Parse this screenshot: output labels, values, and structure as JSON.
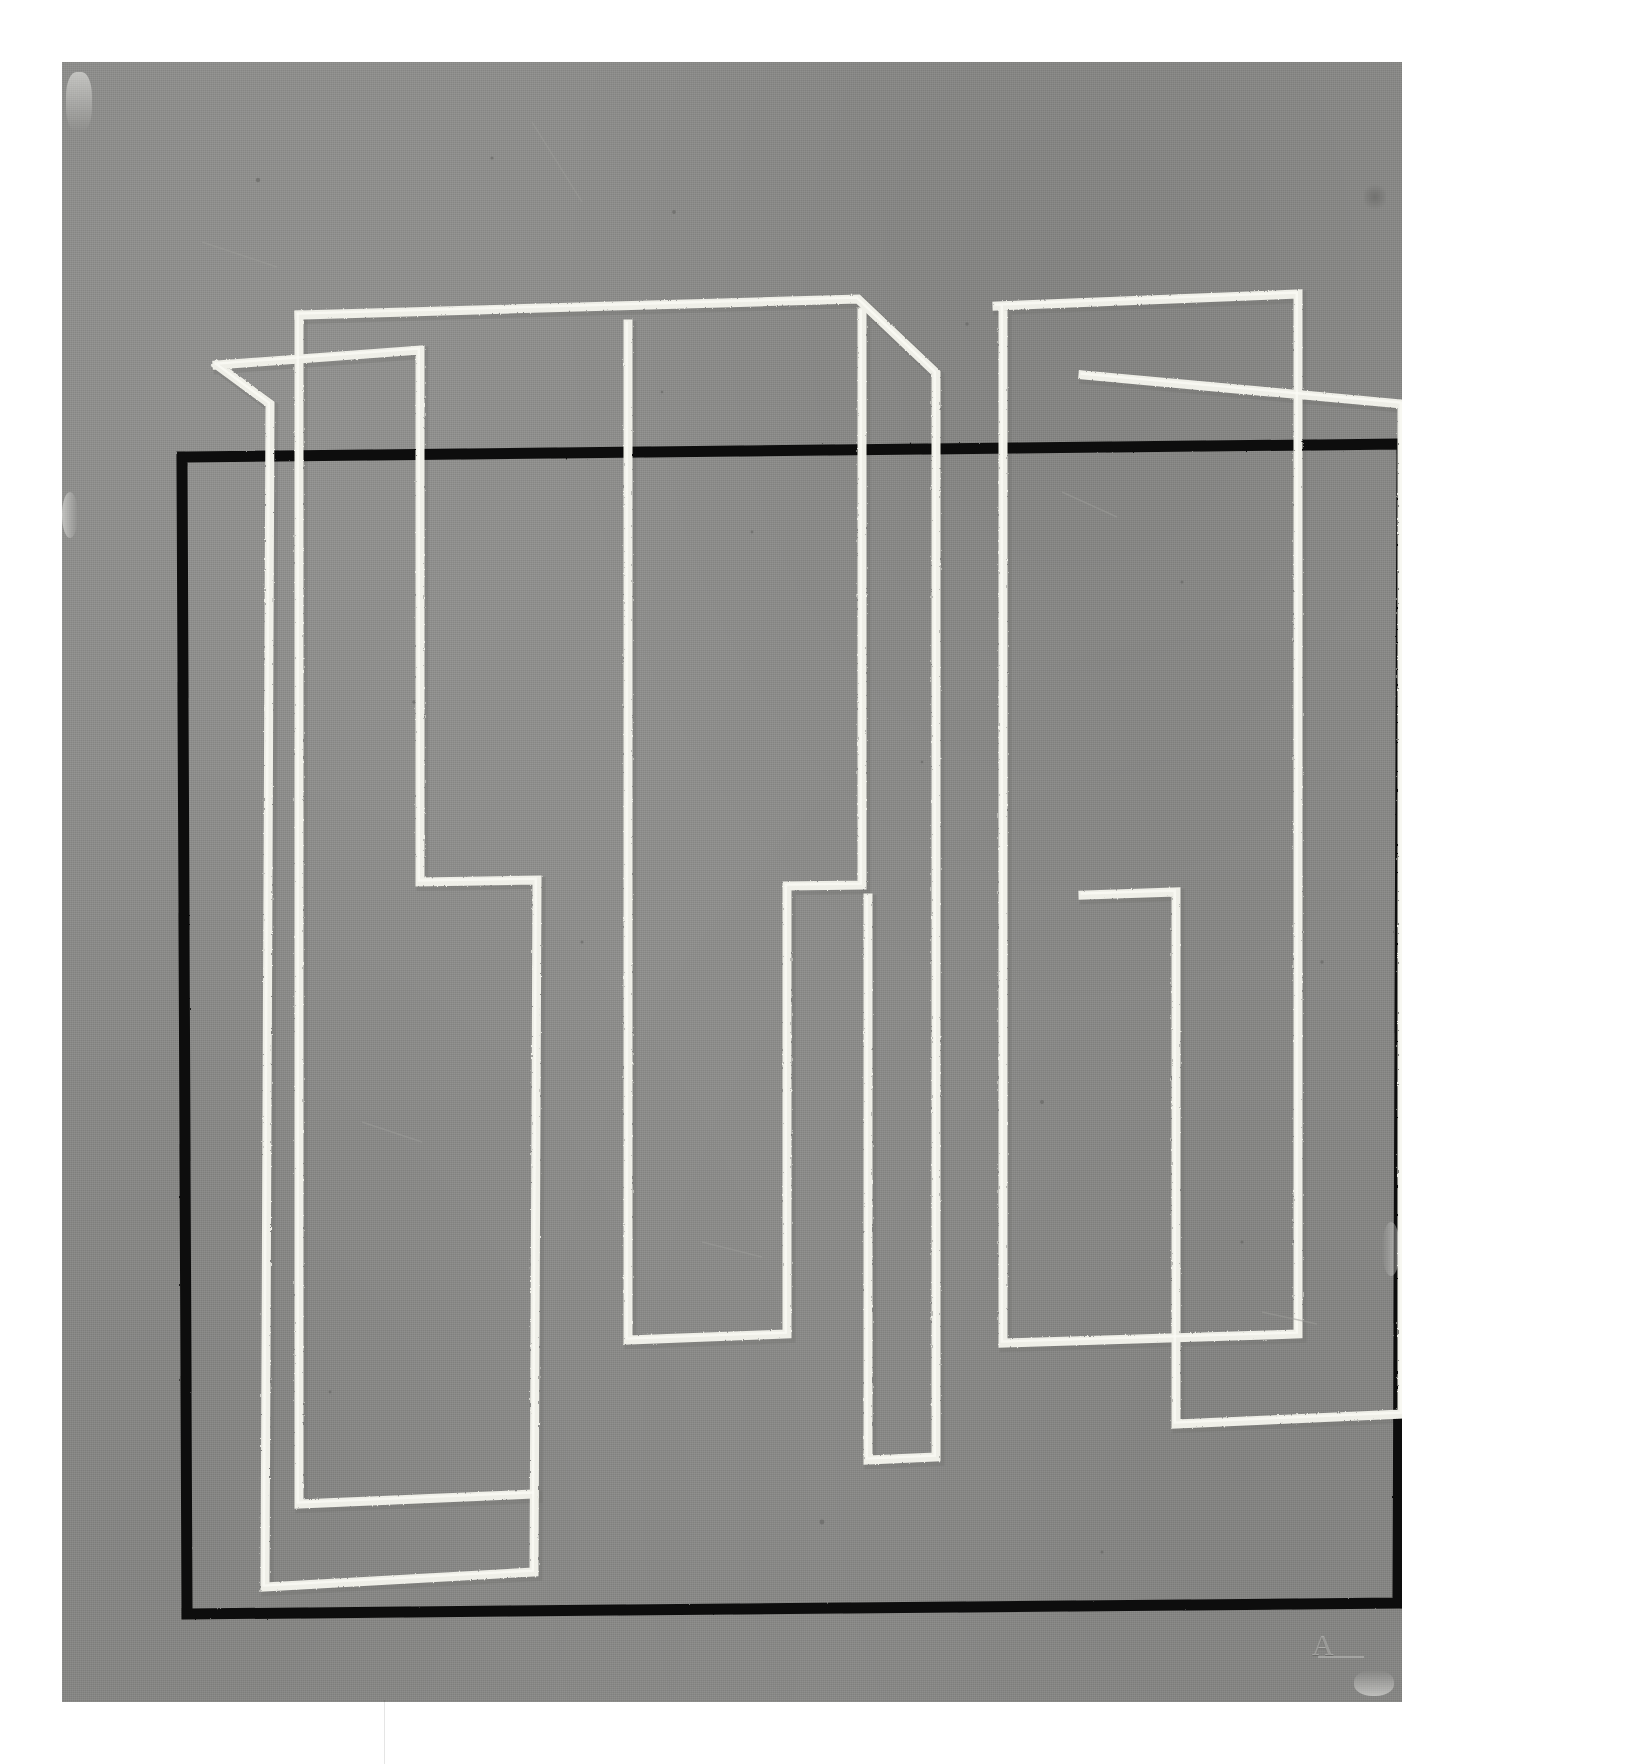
{
  "artwork": {
    "title": "Untitled Geometric Abstraction",
    "medium_surface": "gray primed canvas",
    "signature_text": "A",
    "palette": {
      "canvas_ground": "#8a8a88",
      "paper_surround": "#ffffff",
      "line_white": "#efefe8",
      "line_white_shadow": "#b9b9b2",
      "line_black": "#0d0d0d",
      "canvas_shadow": "#6f6f6d"
    },
    "composition": {
      "panel_label": "artwork-panel",
      "canvas_rect": {
        "x": 62,
        "y": 62,
        "width": 1340,
        "height": 1640
      },
      "black_frame": {
        "name": "black-rectangle-outline",
        "stroke_color": "#0d0d0d",
        "stroke_width": 11,
        "points": "120,395 1340,382 1336,1541 125,1552"
      },
      "white_shapes": [
        {
          "name": "white-shape-1-left-outer",
          "stroke_color": "#efefe8",
          "stroke_width": 9,
          "points": "155,303 358,288 358,820 475,818 472,1510 203,1525 208,342 155,303",
          "closed": false
        },
        {
          "name": "white-shape-2-left-inner",
          "stroke_color": "#efefe8",
          "stroke_width": 9,
          "points": "237,253 237,1442 472,1432",
          "closed": false
        },
        {
          "name": "white-shape-3-center-tall",
          "stroke_color": "#efefe8",
          "stroke_width": 9,
          "points": "566,262 566,1278 725,1272 725,824 800,823 800,250",
          "closed": false
        },
        {
          "name": "white-shape-4-center-upper",
          "stroke_color": "#efefe8",
          "stroke_width": 9,
          "points": "237,253 796,237 874,311 874,1395 806,1398 806,836",
          "closed": false
        },
        {
          "name": "white-shape-5-right-tall",
          "stroke_color": "#efefe8",
          "stroke_width": 9,
          "points": "935,244 1236,232 1236,1272 941,1281 941,244",
          "closed": false
        },
        {
          "name": "white-shape-6-right-inner",
          "stroke_color": "#efefe8",
          "stroke_width": 9,
          "points": "1021,313 1340,342 1340,1352 1114,1362 1114,830 1021,833",
          "closed": false
        },
        {
          "name": "white-shape-7-bottom-connector",
          "stroke_color": "#efefe8",
          "stroke_width": 9,
          "points": "566,1278 725,1272",
          "closed": false
        }
      ],
      "line_counts": {
        "white_polylines": 7,
        "black_polylines": 1
      }
    }
  },
  "viewer": {
    "zoom_level": "100%",
    "alt_text": "Abstract painting: interlocking white rectilinear outlines over a gray canvas, crossed by a large black rectangle outline."
  }
}
